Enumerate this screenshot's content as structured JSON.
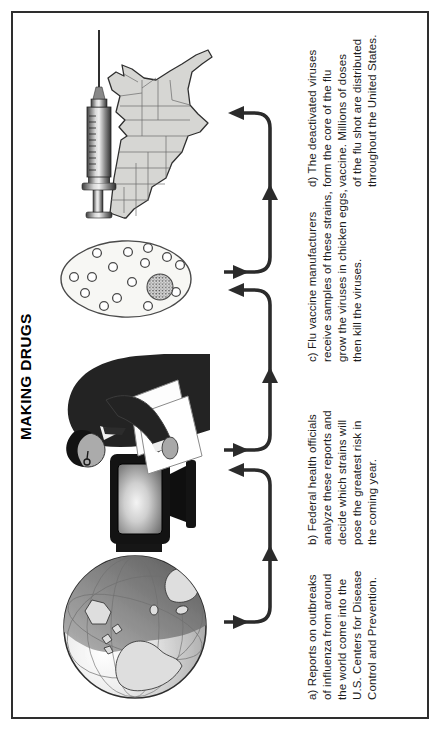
{
  "title": "MAKING DRUGS",
  "steps": [
    {
      "label": "a",
      "image": "globe",
      "caption": "a) Reports on outbreaks\nof influenza from around\nthe world come into the\nU.S. Centers for Disease\nControl and Prevention."
    },
    {
      "label": "b",
      "image": "man-at-computer",
      "caption": "b) Federal health officials\nanalyze these reports and\ndecide which strains will\npose the greatest risk in\nthe coming year."
    },
    {
      "label": "c",
      "image": "egg-with-virus-samples",
      "caption": "c) Flu vaccine manufacturers\nreceive samples of these strains,\ngrow the viruses in chicken eggs,\nthen kill the viruses."
    },
    {
      "label": "d",
      "image": "syringe-and-us-map",
      "caption": "d) The deactivated viruses\nform the core of the flu\nvaccine. Millions of doses\nof the flu shot are distributed\nthroughout the United States."
    }
  ],
  "colors": {
    "ink": "#2b2b2b",
    "frame": "#2e2e2e",
    "background": "#ffffff",
    "text": "#1d1d1d",
    "illustration_light": "#d6d6d3",
    "illustration_dark": "#232323"
  }
}
